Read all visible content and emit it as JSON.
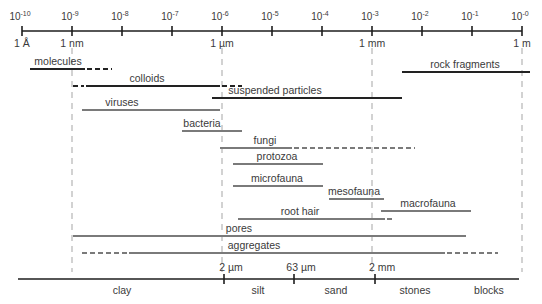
{
  "diagram": {
    "top_axis": {
      "y": 31,
      "x_start": 22,
      "x_end": 522,
      "ticks": [
        {
          "x": 22,
          "exp": "-10",
          "below": "1 Å"
        },
        {
          "x": 72,
          "exp": "-9",
          "below": "1 nm"
        },
        {
          "x": 122,
          "exp": "-8",
          "below": ""
        },
        {
          "x": 172,
          "exp": "-7",
          "below": ""
        },
        {
          "x": 222,
          "exp": "-6",
          "below": "1 µm"
        },
        {
          "x": 272,
          "exp": "-5",
          "below": ""
        },
        {
          "x": 322,
          "exp": "-4",
          "below": ""
        },
        {
          "x": 372,
          "exp": "-3",
          "below": "1 mm"
        },
        {
          "x": 422,
          "exp": "-2",
          "below": ""
        },
        {
          "x": 472,
          "exp": "-1",
          "below": ""
        },
        {
          "x": 522,
          "exp": "-0",
          "below": "1 m"
        }
      ],
      "base": "10"
    },
    "guides": [
      72,
      222,
      372,
      522
    ],
    "ranges": [
      {
        "label": "molecules",
        "y": 69,
        "label_x": 58,
        "color": "#222222",
        "segments": [
          {
            "x1": 30,
            "x2": 85,
            "dash": false
          },
          {
            "x1": 87,
            "x2": 112,
            "dash": true
          }
        ]
      },
      {
        "label": "colloids",
        "y": 86,
        "label_x": 147,
        "color": "#222222",
        "segments": [
          {
            "x1": 73,
            "x2": 84,
            "dash": true
          },
          {
            "x1": 86,
            "x2": 220,
            "dash": false
          },
          {
            "x1": 222,
            "x2": 242,
            "dash": true
          }
        ]
      },
      {
        "label": "rock fragments",
        "y": 72,
        "label_x": 465,
        "color": "#222222",
        "segments": [
          {
            "x1": 402,
            "x2": 530,
            "dash": false
          }
        ]
      },
      {
        "label": "suspended particles",
        "y": 98,
        "label_x": 275,
        "color": "#222222",
        "segments": [
          {
            "x1": 212,
            "x2": 402,
            "dash": false
          }
        ]
      },
      {
        "label": "viruses",
        "y": 110,
        "label_x": 122,
        "color": "#7a7a7a",
        "segments": [
          {
            "x1": 82,
            "x2": 220,
            "dash": false
          }
        ]
      },
      {
        "label": "bacteria",
        "y": 131,
        "label_x": 202,
        "color": "#7a7a7a",
        "segments": [
          {
            "x1": 182,
            "x2": 242,
            "dash": false
          }
        ]
      },
      {
        "label": "fungi",
        "y": 148,
        "label_x": 265,
        "color": "#7a7a7a",
        "segments": [
          {
            "x1": 220,
            "x2": 292,
            "dash": false
          },
          {
            "x1": 294,
            "x2": 415,
            "dash": true
          }
        ]
      },
      {
        "label": "protozoa",
        "y": 164,
        "label_x": 277,
        "color": "#7a7a7a",
        "segments": [
          {
            "x1": 233,
            "x2": 323,
            "dash": false
          }
        ]
      },
      {
        "label": "microfauna",
        "y": 186,
        "label_x": 277,
        "color": "#7a7a7a",
        "segments": [
          {
            "x1": 233,
            "x2": 323,
            "dash": false
          }
        ]
      },
      {
        "label": "mesofauna",
        "y": 199,
        "label_x": 354,
        "color": "#7a7a7a",
        "segments": [
          {
            "x1": 329,
            "x2": 384,
            "dash": false
          }
        ]
      },
      {
        "label": "macrofauna",
        "y": 211,
        "label_x": 428,
        "color": "#7a7a7a",
        "segments": [
          {
            "x1": 381,
            "x2": 471,
            "dash": false
          }
        ]
      },
      {
        "label": "root hair",
        "y": 219,
        "label_x": 300,
        "color": "#7a7a7a",
        "segments": [
          {
            "x1": 238,
            "x2": 385,
            "dash": false
          },
          {
            "x1": 387,
            "x2": 395,
            "dash": true
          }
        ]
      },
      {
        "label": "pores",
        "y": 236,
        "label_x": 239,
        "color": "#7a7a7a",
        "segments": [
          {
            "x1": 73,
            "x2": 466,
            "dash": false
          }
        ]
      },
      {
        "label": "aggregates",
        "y": 253,
        "label_x": 254,
        "color": "#7a7a7a",
        "segments": [
          {
            "x1": 82,
            "x2": 127,
            "dash": true
          },
          {
            "x1": 129,
            "x2": 445,
            "dash": false
          },
          {
            "x1": 447,
            "x2": 498,
            "dash": true
          }
        ]
      }
    ],
    "bottom_axis": {
      "y": 279,
      "x_start": 18,
      "x_end": 519,
      "ticks": [
        {
          "x": 224,
          "label": "2 µm"
        },
        {
          "x": 294,
          "label": "63 µm"
        },
        {
          "x": 375,
          "label": "2 mm"
        }
      ],
      "classes": [
        {
          "label": "clay",
          "x": 122
        },
        {
          "label": "silt",
          "x": 258
        },
        {
          "label": "sand",
          "x": 336
        },
        {
          "label": "stones",
          "x": 415
        },
        {
          "label": "blocks",
          "x": 489
        }
      ]
    },
    "colors": {
      "axis": "#1e1e1e",
      "text": "#3a3a3a",
      "guide": "#b5b5b5",
      "dark_bar": "#222222",
      "gray_bar": "#7a7a7a"
    }
  }
}
